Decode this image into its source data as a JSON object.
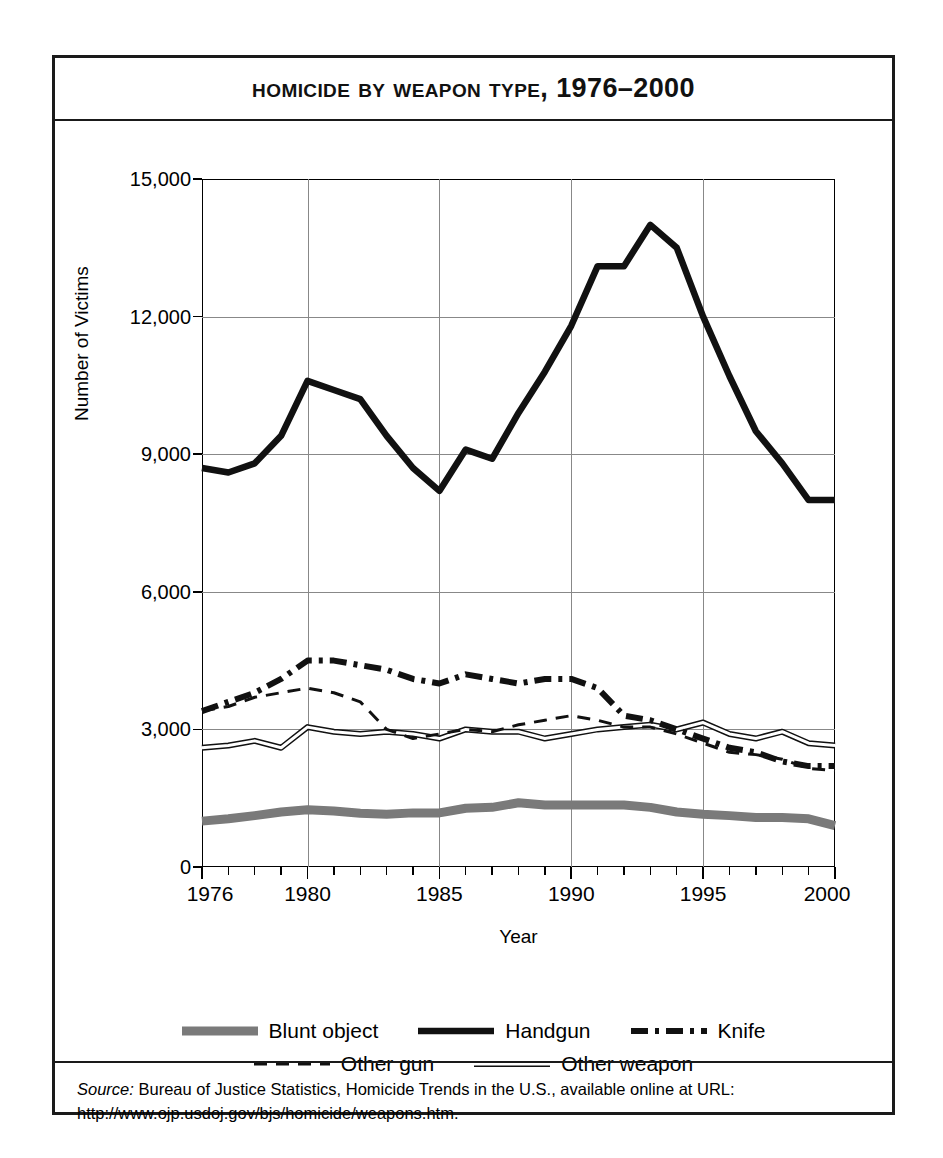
{
  "figure": {
    "title": "Homicide by Weapon Type, 1976–2000",
    "source_label": "Source:",
    "source_body": " Bureau of Justice Statistics, Homicide Trends in the U.S., available online at URL:",
    "source_url": "http://www.ojp.usdoj.gov/bjs/homicide/weapons.htm."
  },
  "axes": {
    "ylabel": "Number of Victims",
    "xlabel": "Year",
    "ytick_labels": [
      "15,000",
      "12,000",
      "9,000",
      "6,000",
      "3,000",
      "0"
    ],
    "xtick_labels": [
      "1976",
      "1980",
      "1985",
      "1990",
      "1995",
      "2000"
    ]
  },
  "legend": {
    "row1": [
      {
        "label": "Blunt object",
        "style": "thick-gray",
        "color": "#7a7a7a"
      },
      {
        "label": "Handgun",
        "style": "thick-solid",
        "color": "#111111"
      },
      {
        "label": "Knife",
        "style": "dash-dot",
        "color": "#111111"
      }
    ],
    "row2": [
      {
        "label": "Other gun",
        "style": "dashed",
        "color": "#111111"
      },
      {
        "label": "Other weapon",
        "style": "double-line",
        "color": "#111111"
      }
    ]
  },
  "chart_data": {
    "type": "line",
    "title": "Homicide by Weapon Type, 1976–2000",
    "xlabel": "Year",
    "ylabel": "Number of Victims",
    "xlim": [
      1976,
      2000
    ],
    "ylim": [
      0,
      15000
    ],
    "ytick_values": [
      0,
      3000,
      6000,
      9000,
      12000,
      15000
    ],
    "xtick_values": [
      1976,
      1980,
      1985,
      1990,
      1995,
      2000
    ],
    "grid": "both",
    "legend_position": "below-axes",
    "x": [
      1976,
      1977,
      1978,
      1979,
      1980,
      1981,
      1982,
      1983,
      1984,
      1985,
      1986,
      1987,
      1988,
      1989,
      1990,
      1991,
      1992,
      1993,
      1994,
      1995,
      1996,
      1997,
      1998,
      1999,
      2000
    ],
    "series": [
      {
        "name": "Handgun",
        "style": "thick-solid",
        "color": "#111111",
        "values": [
          8700,
          8600,
          8800,
          9400,
          10600,
          10400,
          10200,
          9400,
          8700,
          8200,
          9100,
          8900,
          9900,
          10800,
          11800,
          13100,
          13100,
          14000,
          13500,
          12000,
          10700,
          9500,
          8800,
          8000,
          8000
        ]
      },
      {
        "name": "Knife",
        "style": "dash-dot",
        "color": "#111111",
        "values": [
          3400,
          3600,
          3800,
          4100,
          4500,
          4500,
          4400,
          4300,
          4100,
          4000,
          4200,
          4100,
          4000,
          4100,
          4100,
          3900,
          3300,
          3200,
          3000,
          2800,
          2600,
          2500,
          2300,
          2200,
          2200
        ]
      },
      {
        "name": "Other gun",
        "style": "dashed",
        "color": "#111111",
        "values": [
          3400,
          3500,
          3700,
          3800,
          3900,
          3800,
          3600,
          3000,
          2800,
          2900,
          3000,
          2950,
          3100,
          3200,
          3300,
          3200,
          3050,
          3050,
          2900,
          2700,
          2500,
          2450,
          2350,
          2150,
          2100
        ]
      },
      {
        "name": "Other weapon",
        "style": "double-line",
        "color": "#111111",
        "values": [
          2600,
          2650,
          2750,
          2600,
          3050,
          2950,
          2900,
          2950,
          2900,
          2800,
          3000,
          2950,
          2950,
          2800,
          2900,
          3000,
          3050,
          3100,
          3000,
          3150,
          2900,
          2800,
          2950,
          2700,
          2650
        ]
      },
      {
        "name": "Blunt object",
        "style": "thick-gray",
        "color": "#7a7a7a",
        "values": [
          1000,
          1050,
          1120,
          1200,
          1250,
          1220,
          1170,
          1150,
          1180,
          1180,
          1280,
          1300,
          1400,
          1350,
          1350,
          1350,
          1350,
          1300,
          1200,
          1150,
          1120,
          1080,
          1080,
          1050,
          900
        ]
      }
    ]
  }
}
